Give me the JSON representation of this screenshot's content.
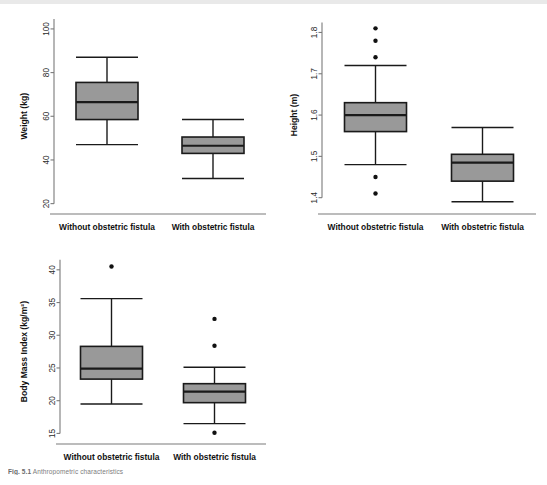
{
  "figure": {
    "caption_prefix": "Fig. 5.1",
    "caption_text": "Anthropometric characteristics",
    "background": "#ffffff",
    "box_fill": "#999999",
    "box_stroke": "#1a1a1a",
    "axis_color": "#7a7a7a",
    "outlier_color": "#111111"
  },
  "categories": [
    "Without obstetric fistula",
    "With obstetric fistula"
  ],
  "chart_data": [
    {
      "type": "box",
      "panel": "weight",
      "title": "",
      "xlabel": "",
      "ylabel": "Weight (kg)",
      "ylim": [
        18,
        105
      ],
      "yticks": [
        20,
        40,
        60,
        80,
        100
      ],
      "ytick_labels": [
        "20",
        "40",
        "60",
        "80",
        "100"
      ],
      "grid": false,
      "legend": "none",
      "categories": [
        "Without obstetric fistula",
        "With obstetric fistula"
      ],
      "boxes": [
        {
          "name": "Without obstetric fistula",
          "min": 47.0,
          "q1": 58.5,
          "median": 66.5,
          "q3": 75.5,
          "max": 87.0,
          "outliers": []
        },
        {
          "name": "With obstetric fistula",
          "min": 31.5,
          "q1": 43.0,
          "median": 46.5,
          "q3": 50.5,
          "max": 58.5,
          "outliers": []
        }
      ]
    },
    {
      "type": "box",
      "panel": "height",
      "title": "",
      "xlabel": "",
      "ylabel": "Height (m)",
      "ylim": [
        1.375,
        1.835
      ],
      "yticks": [
        1.4,
        1.5,
        1.6,
        1.7,
        1.8
      ],
      "ytick_labels": [
        "1.4",
        "1.5",
        "1.6",
        "1.7",
        "1.8"
      ],
      "grid": false,
      "legend": "none",
      "categories": [
        "Without obstetric fistula",
        "With obstetric fistula"
      ],
      "boxes": [
        {
          "name": "Without obstetric fistula",
          "min": 1.48,
          "q1": 1.56,
          "median": 1.6,
          "q3": 1.63,
          "max": 1.72,
          "outliers": [
            1.81,
            1.78,
            1.74,
            1.45,
            1.41
          ]
        },
        {
          "name": "With obstetric fistula",
          "min": 1.39,
          "q1": 1.44,
          "median": 1.485,
          "q3": 1.505,
          "max": 1.57,
          "outliers": []
        }
      ]
    },
    {
      "type": "box",
      "panel": "bmi",
      "title": "",
      "xlabel": "",
      "ylabel": "Body Mass Index (kg/m²)",
      "ylim": [
        14.3,
        41.5
      ],
      "yticks": [
        15,
        20,
        25,
        30,
        35,
        40
      ],
      "ytick_labels": [
        "15",
        "20",
        "25",
        "30",
        "35",
        "40"
      ],
      "grid": false,
      "legend": "none",
      "categories": [
        "Without obstetric fistula",
        "With obstetric fistula"
      ],
      "boxes": [
        {
          "name": "Without obstetric fistula",
          "min": 19.5,
          "q1": 23.3,
          "median": 24.9,
          "q3": 28.3,
          "max": 35.6,
          "outliers": [
            40.5
          ]
        },
        {
          "name": "With obstetric fistula",
          "min": 16.5,
          "q1": 19.7,
          "median": 21.4,
          "q3": 22.6,
          "max": 25.1,
          "outliers": [
            32.5,
            28.4,
            15.1
          ]
        }
      ]
    }
  ]
}
